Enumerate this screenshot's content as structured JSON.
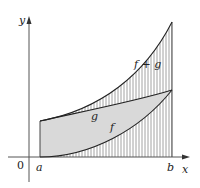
{
  "figure": {
    "type": "integral-sum-diagram",
    "axes": {
      "x_label": "x",
      "y_label": "y",
      "origin_label": "0"
    },
    "interval": {
      "a_label": "a",
      "b_label": "b"
    },
    "curves": [
      {
        "name": "f",
        "label": "f"
      },
      {
        "name": "g",
        "label": "g"
      },
      {
        "name": "f+g",
        "label": "f + g"
      }
    ],
    "regions": [
      {
        "name": "under-f",
        "fill": "vertical-hatch"
      },
      {
        "name": "between-f-and-g",
        "fill": "gray",
        "color": "#d9d9d9"
      },
      {
        "name": "between-g-and-f+g",
        "fill": "vertical-hatch"
      }
    ],
    "colors": {
      "axis": "#555555",
      "curve": "#333333",
      "hatch": "#8a8a8a",
      "gray_fill": "#d9d9d9"
    }
  }
}
